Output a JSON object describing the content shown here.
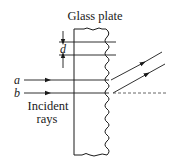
{
  "diagram": {
    "title": "Glass plate",
    "spacing_label": "d",
    "rays": [
      {
        "label": "a"
      },
      {
        "label": "b"
      }
    ],
    "incident_label_line1": "Incident",
    "incident_label_line2": "rays",
    "colors": {
      "stroke": "#1a1a1a",
      "dashed": "#555555",
      "background": "#ffffff"
    }
  }
}
